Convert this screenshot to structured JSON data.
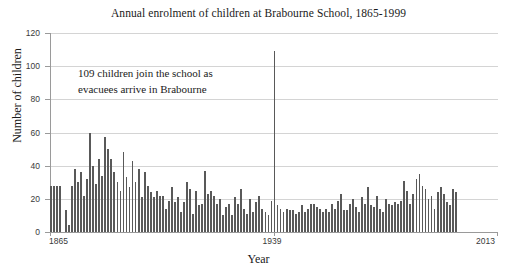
{
  "chart_data": {
    "type": "bar",
    "title": "Annual enrolment of children at Brabourne School, 1865-1999",
    "xlabel": "Year",
    "ylabel": "Number of children",
    "xlim": [
      1865,
      2013
    ],
    "ylim": [
      0,
      120
    ],
    "grid": true,
    "legend": "none",
    "bar_color": "#595959",
    "annotations": [
      {
        "text": "109 children join the school as evacuees arrive in Brabourne",
        "line1": "109 children join the school as",
        "line2": "evacuees arrive in Brabourne",
        "x": 1939,
        "y": 109
      }
    ],
    "ytick_labels": [
      "0",
      "20",
      "40",
      "60",
      "80",
      "100",
      "120"
    ],
    "ytick_values": [
      0,
      20,
      40,
      60,
      80,
      100,
      120
    ],
    "xtick_labels": [
      "1865",
      "1939",
      "2013"
    ],
    "xtick_values": [
      1865,
      1939,
      2013
    ],
    "x": [
      1865,
      1866,
      1867,
      1868,
      1869,
      1870,
      1871,
      1872,
      1873,
      1874,
      1875,
      1876,
      1877,
      1878,
      1879,
      1880,
      1881,
      1882,
      1883,
      1884,
      1885,
      1886,
      1887,
      1888,
      1889,
      1890,
      1891,
      1892,
      1893,
      1894,
      1895,
      1896,
      1897,
      1898,
      1899,
      1900,
      1901,
      1902,
      1903,
      1904,
      1905,
      1906,
      1907,
      1908,
      1909,
      1910,
      1911,
      1912,
      1913,
      1914,
      1915,
      1916,
      1917,
      1918,
      1919,
      1920,
      1921,
      1922,
      1923,
      1924,
      1925,
      1926,
      1927,
      1928,
      1929,
      1930,
      1931,
      1932,
      1933,
      1934,
      1935,
      1936,
      1937,
      1938,
      1939,
      1940,
      1941,
      1942,
      1943,
      1944,
      1945,
      1946,
      1947,
      1948,
      1949,
      1950,
      1951,
      1952,
      1953,
      1954,
      1955,
      1956,
      1957,
      1958,
      1959,
      1960,
      1961,
      1962,
      1963,
      1964,
      1965,
      1966,
      1967,
      1968,
      1969,
      1970,
      1971,
      1972,
      1973,
      1974,
      1975,
      1976,
      1977,
      1978,
      1979,
      1980,
      1981,
      1982,
      1983,
      1984,
      1985,
      1986,
      1987,
      1988,
      1989,
      1990,
      1991,
      1992,
      1993,
      1994,
      1995,
      1996,
      1997,
      1998,
      1999
    ],
    "values": [
      28,
      28,
      28,
      28,
      0,
      13,
      4,
      28,
      38,
      30,
      36,
      22,
      32,
      60,
      40,
      29,
      44,
      34,
      57,
      50,
      44,
      36,
      30,
      25,
      48,
      33,
      27,
      43,
      30,
      38,
      21,
      36,
      28,
      24,
      21,
      25,
      22,
      22,
      14,
      19,
      27,
      18,
      21,
      12,
      18,
      30,
      26,
      11,
      25,
      16,
      17,
      37,
      23,
      25,
      22,
      17,
      20,
      10,
      15,
      17,
      10,
      21,
      17,
      26,
      14,
      11,
      20,
      12,
      18,
      22,
      14,
      12,
      10,
      19,
      109,
      16,
      14,
      12,
      14,
      13,
      13,
      11,
      12,
      16,
      12,
      14,
      17,
      17,
      15,
      14,
      12,
      14,
      12,
      17,
      14,
      19,
      23,
      13,
      13,
      17,
      20,
      15,
      12,
      21,
      17,
      27,
      16,
      15,
      22,
      14,
      12,
      20,
      17,
      16,
      18,
      17,
      19,
      31,
      25,
      17,
      23,
      32,
      35,
      28,
      26,
      20,
      22,
      14,
      24,
      27,
      23,
      18,
      16,
      26,
      24
    ]
  }
}
